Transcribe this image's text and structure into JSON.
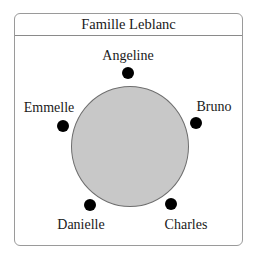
{
  "diagram": {
    "title": "Famille Leblanc",
    "table": {
      "shape": "circle",
      "fill": "#c8c8c8",
      "stroke": "#6e6e6e"
    },
    "seat_color": "#000000",
    "frame_border": "#9a9a9a",
    "seats": [
      {
        "name": "Angeline",
        "position": "top"
      },
      {
        "name": "Bruno",
        "position": "upper-right"
      },
      {
        "name": "Charles",
        "position": "lower-right"
      },
      {
        "name": "Danielle",
        "position": "lower-left"
      },
      {
        "name": "Emmelle",
        "position": "upper-left"
      }
    ]
  }
}
